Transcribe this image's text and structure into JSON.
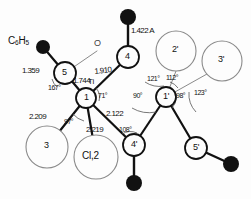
{
  "figure": {
    "kind": "molecular-structure-diagram",
    "unit_note": "1.422 A",
    "colors": {
      "ink": "#111111",
      "thin_line": "#8a8a8a",
      "filled_atom": "#111111",
      "background": "#fdfdfd"
    }
  },
  "atoms": [
    {
      "id": "c6h5",
      "label": "C6H5",
      "text": "C",
      "sub1": "6",
      "mid": "H",
      "sub2": "5",
      "style": "text",
      "x": 22,
      "y": 42
    },
    {
      "id": "dot-ph",
      "label": "",
      "style": "filled-dot",
      "x": 43,
      "y": 47,
      "r": 7
    },
    {
      "id": "o5",
      "label": "O",
      "style": "text-o",
      "x": 99,
      "y": 46
    },
    {
      "id": "a5",
      "label": "5",
      "style": "open-circle",
      "x": 65,
      "y": 73,
      "r": 11
    },
    {
      "id": "a4",
      "label": "4",
      "style": "open-circle",
      "x": 128,
      "y": 57,
      "r": 11
    },
    {
      "id": "dot4",
      "label": "",
      "style": "filled-dot",
      "x": 128,
      "y": 17,
      "r": 8
    },
    {
      "id": "a1",
      "label": "1",
      "sup": "Ti",
      "style": "open-circle",
      "x": 86,
      "y": 98,
      "r": 10
    },
    {
      "id": "a1p",
      "label": "1'",
      "style": "open-circle",
      "x": 166,
      "y": 97,
      "r": 10
    },
    {
      "id": "a2p",
      "label": "2'",
      "style": "thin-circle",
      "x": 176,
      "y": 51,
      "r": 20
    },
    {
      "id": "a3p",
      "label": "3'",
      "style": "thin-circle",
      "x": 222,
      "y": 61,
      "r": 20
    },
    {
      "id": "a3",
      "label": "3",
      "style": "thin-circle",
      "x": 47,
      "y": 147,
      "r": 21
    },
    {
      "id": "cl2",
      "label": "Cl,2",
      "style": "thin-circle",
      "x": 96,
      "y": 157,
      "r": 22
    },
    {
      "id": "a4p",
      "label": "4'",
      "style": "open-circle",
      "x": 134,
      "y": 145,
      "r": 11
    },
    {
      "id": "dot4p",
      "label": "",
      "style": "filled-dot",
      "x": 134,
      "y": 183,
      "r": 8
    },
    {
      "id": "a5p",
      "label": "5'",
      "style": "open-circle",
      "x": 196,
      "y": 148,
      "r": 11
    },
    {
      "id": "dot5p",
      "label": "",
      "style": "filled-dot",
      "x": 231,
      "y": 164,
      "r": 8
    }
  ],
  "bonds": [
    {
      "from": "dot-ph",
      "to": "a5",
      "weight": "thick"
    },
    {
      "from": "a5",
      "to": "o5",
      "weight": "thin"
    },
    {
      "from": "a5",
      "to": "a1",
      "weight": "thick"
    },
    {
      "from": "a1",
      "to": "a4",
      "weight": "thick"
    },
    {
      "from": "a4",
      "to": "dot4",
      "weight": "thick"
    },
    {
      "from": "a1",
      "to": "a3",
      "weight": "thick"
    },
    {
      "from": "a1",
      "to": "cl2",
      "weight": "thick"
    },
    {
      "from": "a1",
      "to": "a4p",
      "weight": "thick"
    },
    {
      "from": "a4p",
      "to": "a1p",
      "weight": "thick"
    },
    {
      "from": "a4p",
      "to": "dot4p",
      "weight": "thick"
    },
    {
      "from": "a1p",
      "to": "a2p",
      "weight": "thin"
    },
    {
      "from": "a1p",
      "to": "a3p",
      "weight": "thin"
    },
    {
      "from": "a1p",
      "to": "a5p",
      "weight": "thick"
    },
    {
      "from": "a5p",
      "to": "dot5p",
      "weight": "thick"
    }
  ],
  "bond_labels": [
    {
      "id": "bl-1359",
      "value": "1.359",
      "x": 22,
      "y": 67,
      "rot": 0
    },
    {
      "id": "bl-1422",
      "value": "1.422 A",
      "x": 131,
      "y": 27,
      "rot": 0
    },
    {
      "id": "bl-1910",
      "value": "1.910",
      "x": 94,
      "y": 68,
      "rot": -4
    },
    {
      "id": "bl-1744",
      "value": "1.744",
      "x": 73,
      "y": 78,
      "rot": 0
    },
    {
      "id": "bl-2209",
      "value": "2.209",
      "x": 32,
      "y": 115,
      "rot": 0
    },
    {
      "id": "bl-2219",
      "value": "2.219",
      "x": 88,
      "y": 127,
      "rot": 0
    },
    {
      "id": "bl-2122",
      "value": "2.122",
      "x": 108,
      "y": 112,
      "rot": 0
    }
  ],
  "angle_labels": [
    {
      "id": "ang-167",
      "value": "167°",
      "x": 51,
      "y": 85
    },
    {
      "id": "ang-71",
      "value": "71°",
      "x": 99,
      "y": 94
    },
    {
      "id": "ang-97",
      "value": "97°",
      "x": 67,
      "y": 120
    },
    {
      "id": "ang-108",
      "value": "108°",
      "x": 121,
      "y": 128
    },
    {
      "id": "ang-90",
      "value": "90°",
      "x": 136,
      "y": 93
    },
    {
      "id": "ang-98",
      "value": "98°",
      "x": 177,
      "y": 95
    },
    {
      "id": "ang-121",
      "value": "121°",
      "x": 149,
      "y": 76
    },
    {
      "id": "ang-112",
      "value": "112°",
      "x": 168,
      "y": 74
    },
    {
      "id": "ang-123",
      "value": "123°",
      "x": 196,
      "y": 90
    }
  ],
  "central_atom_symbol": "Ti"
}
